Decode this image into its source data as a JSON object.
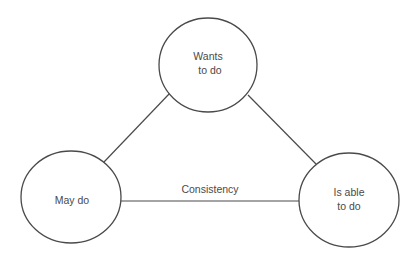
{
  "diagram": {
    "type": "triangle-relationship",
    "colors": {
      "stroke": "#4a4a4a",
      "text": "#4a4a4a",
      "background": "#ffffff"
    },
    "nodes": [
      {
        "id": "wants",
        "lines": [
          "Wants",
          "to do"
        ],
        "position": "top"
      },
      {
        "id": "may",
        "lines": [
          "May do"
        ],
        "position": "bottom-left"
      },
      {
        "id": "able",
        "lines": [
          "Is able",
          "to do"
        ],
        "position": "bottom-right"
      }
    ],
    "edges": [
      {
        "from": "may",
        "to": "wants",
        "label": ""
      },
      {
        "from": "wants",
        "to": "able",
        "label": ""
      },
      {
        "from": "may",
        "to": "able",
        "label": "Consistency"
      }
    ]
  }
}
